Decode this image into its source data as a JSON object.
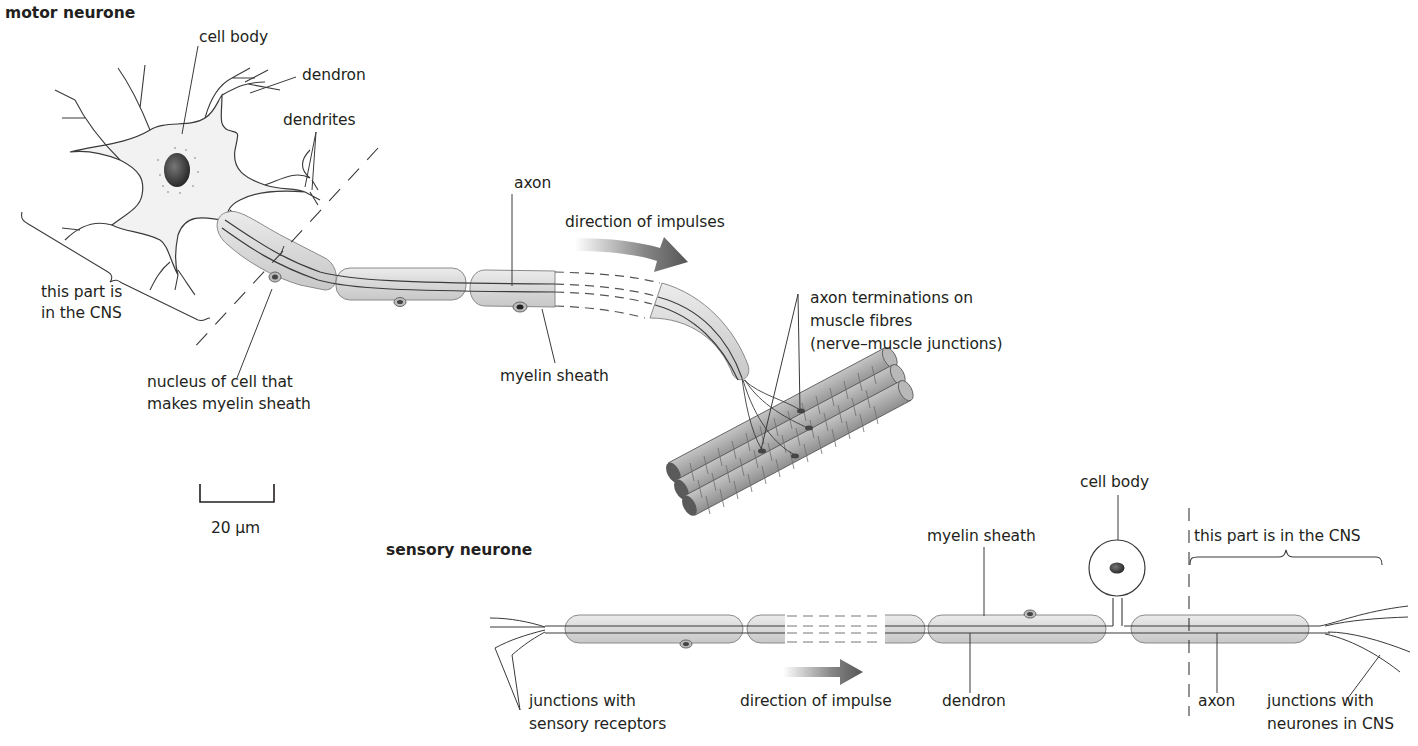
{
  "diagram": {
    "motor": {
      "title": "motor neurone",
      "labels": {
        "cell_body": "cell body",
        "dendron": "dendron",
        "dendrites": "dendrites",
        "axon": "axon",
        "direction": "direction of impulses",
        "cns_line1": "this part is",
        "cns_line2": "in the CNS",
        "nucleus_line1": "nucleus of cell that",
        "nucleus_line2": "makes myelin sheath",
        "myelin": "myelin sheath",
        "terminations_line1": "axon terminations on",
        "terminations_line2": "muscle fibres",
        "terminations_line3": "(nerve–muscle junctions)"
      }
    },
    "scale_bar": {
      "label": "20 μm"
    },
    "sensory": {
      "title": "sensory neurone",
      "labels": {
        "cell_body": "cell body",
        "myelin": "myelin sheath",
        "cns": "this part is in the CNS",
        "receptors_line1": "junctions with",
        "receptors_line2": "sensory receptors",
        "direction": "direction of impulse",
        "dendron": "dendron",
        "axon": "axon",
        "cns_junctions_line1": "junctions with",
        "cns_junctions_line2": "neurones in CNS"
      }
    },
    "colors": {
      "line": "#3a3a3a",
      "cell_fill": "#f2f2f2",
      "myelin_fill": "#dcdcdc",
      "nucleus": "#4a4a4a",
      "arrow": "#555555",
      "muscle": "#a9a9a9"
    }
  }
}
